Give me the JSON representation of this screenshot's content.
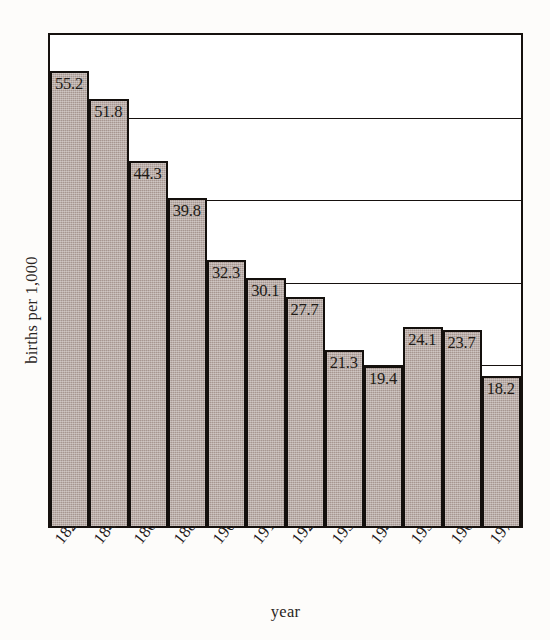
{
  "chart_data": {
    "type": "bar",
    "title": "",
    "subtitle": "",
    "xlabel": "year",
    "ylabel": "births per 1,000",
    "categories": [
      "1820",
      "1840",
      "1860",
      "1880",
      "1900",
      "1910",
      "1920",
      "1930",
      "1940",
      "1950",
      "1960",
      "1970"
    ],
    "values": [
      55.2,
      51.8,
      44.3,
      39.8,
      32.3,
      30.1,
      27.7,
      21.3,
      19.4,
      24.1,
      23.7,
      18.2
    ],
    "value_labels": [
      "55.2",
      "51.8",
      "44.3",
      "39.8",
      "32.3",
      "30.1",
      "27.7",
      "21.3",
      "19.4",
      "24.1",
      "23.7",
      "18.2"
    ],
    "ylim": [
      0,
      60
    ],
    "yticks": [
      0,
      10,
      20,
      30,
      40,
      50,
      60
    ],
    "ytick_labels": [],
    "grid": true,
    "grid_axis": "y",
    "legend": false,
    "legend_position": "none",
    "bar_fill_color": "#a69690",
    "bar_edge_color": "#14100d",
    "axis_color": "#16110e",
    "background_color": "#ffffff"
  },
  "axes": {
    "y_title": "births per 1,000",
    "x_title": "year"
  }
}
